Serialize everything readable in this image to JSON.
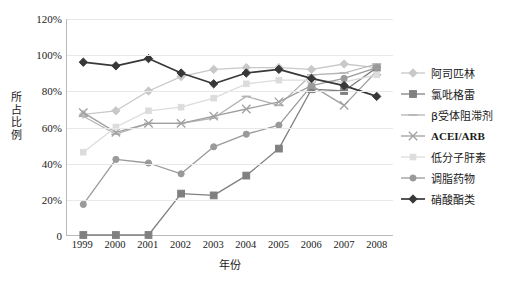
{
  "chart_data": {
    "type": "line",
    "title": "",
    "xlabel": "年份",
    "ylabel": "所占比例",
    "categories": [
      "1999",
      "2000",
      "2001",
      "2002",
      "2003",
      "2004",
      "2005",
      "2006",
      "2007",
      "2008"
    ],
    "x": [
      1999,
      2000,
      2001,
      2002,
      2003,
      2004,
      2005,
      2006,
      2007,
      2008
    ],
    "ylim": [
      0,
      120
    ],
    "ytick_labels": [
      "0",
      "20%",
      "40%",
      "60%",
      "80%",
      "100%",
      "120%"
    ],
    "ytick_values": [
      0,
      20,
      40,
      60,
      80,
      100,
      120
    ],
    "grid": true,
    "legend_position": "right",
    "series": [
      {
        "name": "阿司匹林",
        "marker": "diamond",
        "color": "#c8c8c8",
        "values": [
          67,
          69,
          80,
          88,
          92,
          93,
          93,
          92,
          95,
          93
        ]
      },
      {
        "name": "氯吡格雷",
        "marker": "square",
        "color": "#808080",
        "values": [
          0,
          0,
          0,
          23,
          22,
          33,
          48,
          81,
          80,
          93
        ]
      },
      {
        "name": "β受体阻滞剂",
        "marker": "dash",
        "color": "#b4b4b4",
        "values": [
          66,
          56,
          62,
          62,
          65,
          77,
          72,
          89,
          90,
          95
        ]
      },
      {
        "name": "ACEI/ARB",
        "marker": "x",
        "color": "#a0a0a0",
        "values": [
          68,
          57,
          62,
          62,
          66,
          70,
          74,
          83,
          72,
          91
        ]
      },
      {
        "name": "低分子肝素",
        "marker": "small-square",
        "color": "#dcdcdc",
        "values": [
          46,
          60,
          69,
          71,
          76,
          84,
          86,
          86,
          85,
          89
        ]
      },
      {
        "name": "调脂药物",
        "marker": "circle",
        "color": "#9a9a9a",
        "values": [
          17,
          42,
          40,
          34,
          49,
          56,
          61,
          83,
          87,
          93
        ]
      },
      {
        "name": "硝酸酯类",
        "marker": "diamond",
        "color": "#383838",
        "values": [
          96,
          94,
          98,
          90,
          84,
          90,
          92,
          87,
          83,
          77
        ]
      }
    ]
  }
}
